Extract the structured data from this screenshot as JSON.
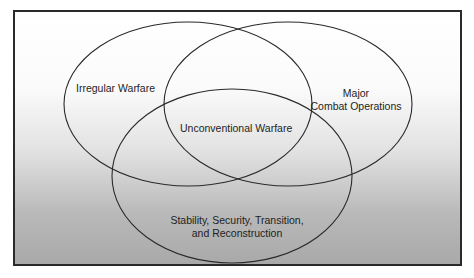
{
  "diagram": {
    "type": "venn",
    "sets": [
      {
        "id": "irregular",
        "label": "Irregular Warfare"
      },
      {
        "id": "major",
        "label_line1": "Major",
        "label_line2": "Combat Operations"
      },
      {
        "id": "stability",
        "label_line1": "Stability, Security, Transition,",
        "label_line2": "and Reconstruction"
      }
    ],
    "intersection": {
      "label": "Unconventional Warfare"
    },
    "colors": {
      "stroke": "#2a2a2a",
      "border": "#2a2a2a",
      "gradient_top": "#ffffff",
      "gradient_bottom": "#a9a9a9"
    }
  }
}
